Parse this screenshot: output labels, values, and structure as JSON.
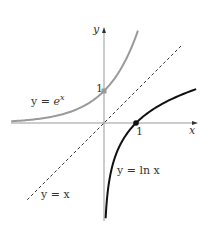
{
  "figure": {
    "origin_px": [
      104,
      123
    ],
    "unit_px": 32,
    "colors": {
      "axis": "#999999",
      "exp_curve": "#9a9a9a",
      "ln_curve": "#111111",
      "identity_line": "#333333",
      "text": "#333333"
    },
    "axes": {
      "x_label": "x",
      "y_label": "y",
      "x_range": [
        -2.9,
        2.9
      ],
      "y_range": [
        -3.0,
        3.2
      ],
      "x_tick_label": "1",
      "y_tick_label": "1"
    },
    "curves": [
      {
        "name": "exp",
        "equation": "y = e^x",
        "label_prefix": "y = ",
        "label_base": "e",
        "label_exp": "x",
        "domain": [
          -2.9,
          1.06
        ],
        "marked_point": [
          0,
          1
        ]
      },
      {
        "name": "ln",
        "equation": "y = ln x",
        "label": "y = ln x",
        "domain": [
          0.051,
          2.88
        ],
        "marked_point": [
          1,
          0
        ]
      },
      {
        "name": "identity",
        "equation": "y = x",
        "label": "y = x",
        "style": "dashed",
        "domain": [
          -2.4,
          2.45
        ]
      }
    ]
  }
}
